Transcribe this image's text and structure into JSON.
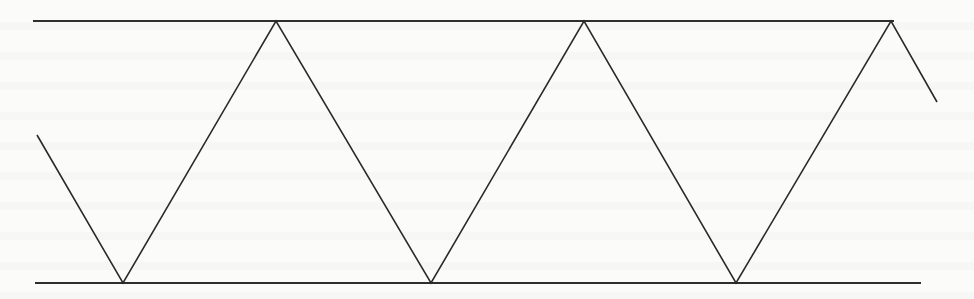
{
  "diagram": {
    "stroke_color": "#2a2a2a",
    "background_color": "#fbfbfa",
    "top_line": {
      "x1": 33,
      "y1": 21,
      "x2": 894,
      "y2": 21
    },
    "bottom_line": {
      "x1": 35,
      "y1": 283,
      "x2": 921,
      "y2": 283
    },
    "zigzag_points": [
      [
        37,
        135
      ],
      [
        123,
        283
      ],
      [
        276,
        21
      ],
      [
        431,
        283
      ],
      [
        584,
        21
      ],
      [
        736,
        283
      ],
      [
        891,
        21
      ],
      [
        937,
        102
      ]
    ],
    "top_vertex_count": 3,
    "bottom_vertex_count": 3
  }
}
